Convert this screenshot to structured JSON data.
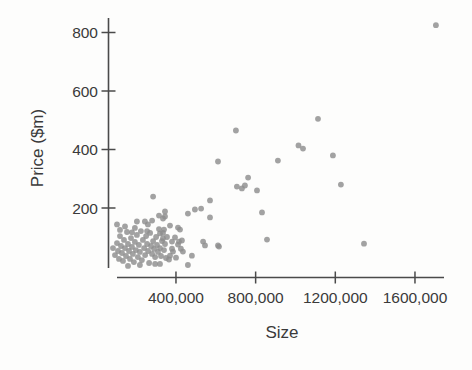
{
  "figure": {
    "kind": "scanned textbook scatter plot",
    "background_color": "#fdfdfc"
  },
  "colors": {
    "marker": "#8e8e8e",
    "axis": "#4a4a4a",
    "text": "#3a3a3a"
  },
  "chart_data": {
    "type": "scatter",
    "title": "",
    "xlabel": "Size",
    "ylabel": "Price ($m)",
    "grid": false,
    "legend": null,
    "xlim": [
      0,
      1850000
    ],
    "ylim": [
      0,
      870
    ],
    "x_ticks": [
      {
        "value": 400000,
        "label": "400,000"
      },
      {
        "value": 800000,
        "label": "800,000"
      },
      {
        "value": 1200000,
        "label": "1200,000"
      },
      {
        "value": 1600000,
        "label": "1600,000"
      }
    ],
    "y_ticks": [
      {
        "value": 200,
        "label": "200"
      },
      {
        "value": 400,
        "label": "400"
      },
      {
        "value": 600,
        "label": "600"
      },
      {
        "value": 800,
        "label": "800"
      }
    ],
    "points": [
      [
        1705000,
        825
      ],
      [
        1113000,
        505
      ],
      [
        1015000,
        414
      ],
      [
        1038000,
        403
      ],
      [
        1188000,
        380
      ],
      [
        912000,
        362
      ],
      [
        701000,
        465
      ],
      [
        762000,
        304
      ],
      [
        611000,
        359
      ],
      [
        1228000,
        280
      ],
      [
        706000,
        273
      ],
      [
        731000,
        267
      ],
      [
        746000,
        277
      ],
      [
        807000,
        260
      ],
      [
        832000,
        185
      ],
      [
        857000,
        92
      ],
      [
        616000,
        68
      ],
      [
        1344000,
        78
      ],
      [
        571000,
        226
      ],
      [
        526000,
        198
      ],
      [
        495000,
        195
      ],
      [
        460000,
        181
      ],
      [
        571000,
        168
      ],
      [
        546000,
        72
      ],
      [
        285000,
        239
      ],
      [
        345000,
        188
      ],
      [
        315000,
        174
      ],
      [
        280000,
        157
      ],
      [
        244000,
        154
      ],
      [
        345000,
        171
      ],
      [
        104000,
        144
      ],
      [
        259000,
        144
      ],
      [
        335000,
        164
      ],
      [
        370000,
        140
      ],
      [
        410000,
        133
      ],
      [
        340000,
        126
      ],
      [
        320000,
        113
      ],
      [
        335000,
        96
      ],
      [
        380000,
        85
      ],
      [
        415000,
        85
      ],
      [
        536000,
        85
      ],
      [
        611000,
        72
      ],
      [
        425000,
        61
      ],
      [
        385000,
        51
      ],
      [
        480000,
        37
      ],
      [
        365000,
        24
      ],
      [
        420000,
        126
      ],
      [
        395000,
        99
      ],
      [
        430000,
        89
      ],
      [
        410000,
        75
      ],
      [
        380000,
        61
      ],
      [
        435000,
        51
      ],
      [
        370000,
        37
      ],
      [
        400000,
        30
      ],
      [
        460000,
        5
      ],
      [
        144000,
        137
      ],
      [
        204000,
        154
      ],
      [
        179000,
        117
      ],
      [
        84000,
        63
      ],
      [
        94000,
        39
      ],
      [
        104000,
        80
      ],
      [
        109000,
        53
      ],
      [
        114000,
        26
      ],
      [
        119000,
        104
      ],
      [
        124000,
        70
      ],
      [
        129000,
        46
      ],
      [
        134000,
        19
      ],
      [
        139000,
        91
      ],
      [
        144000,
        63
      ],
      [
        149000,
        36
      ],
      [
        154000,
        118
      ],
      [
        159000,
        77
      ],
      [
        164000,
        53
      ],
      [
        169000,
        26
      ],
      [
        174000,
        97
      ],
      [
        179000,
        67
      ],
      [
        184000,
        43
      ],
      [
        189000,
        15
      ],
      [
        194000,
        84
      ],
      [
        199000,
        56
      ],
      [
        204000,
        108
      ],
      [
        209000,
        32
      ],
      [
        214000,
        74
      ],
      [
        219000,
        50
      ],
      [
        224000,
        121
      ],
      [
        229000,
        22
      ],
      [
        234000,
        91
      ],
      [
        240000,
        63
      ],
      [
        245000,
        39
      ],
      [
        250000,
        104
      ],
      [
        255000,
        77
      ],
      [
        260000,
        53
      ],
      [
        265000,
        12
      ],
      [
        270000,
        115
      ],
      [
        275000,
        70
      ],
      [
        280000,
        43
      ],
      [
        285000,
        87
      ],
      [
        290000,
        60
      ],
      [
        295000,
        32
      ],
      [
        300000,
        101
      ],
      [
        305000,
        74
      ],
      [
        310000,
        50
      ],
      [
        315000,
        128
      ],
      [
        320000,
        63
      ],
      [
        325000,
        36
      ],
      [
        330000,
        87
      ],
      [
        335000,
        115
      ],
      [
        340000,
        56
      ],
      [
        345000,
        77
      ],
      [
        350000,
        29
      ],
      [
        355000,
        101
      ],
      [
        295000,
        9
      ],
      [
        255000,
        121
      ],
      [
        194000,
        132
      ],
      [
        159000,
        2
      ],
      [
        219000,
        5
      ],
      [
        119000,
        125
      ],
      [
        320000,
        9
      ]
    ]
  }
}
